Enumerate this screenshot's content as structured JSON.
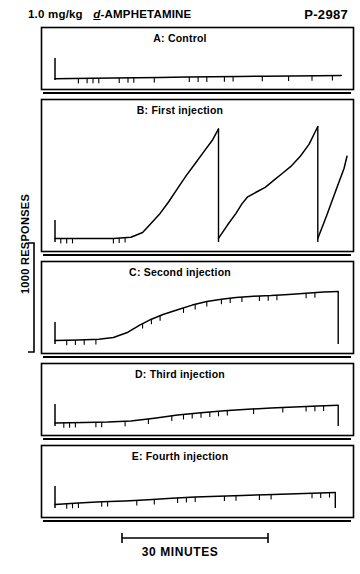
{
  "header": {
    "dose": "1.0 mg/kg",
    "drug_prefix": "d",
    "drug": "-AMPHETAMINE",
    "title_full": "1.0 mg/kg d-AMPHETAMINE",
    "subject_id": "P-2987"
  },
  "axes": {
    "y_label": "1000 RESPONSES",
    "x_label": "30 MINUTES"
  },
  "chart_data": {
    "type": "line",
    "title": "1.0 mg/kg d-AMPHETAMINE",
    "subtitle": "P-2987",
    "xlabel": "30 MINUTES",
    "ylabel": "1000 RESPONSES",
    "grid": false,
    "legend": "none",
    "xlim": [
      0,
      100
    ],
    "ylim": [
      0,
      100
    ],
    "panels": [
      {
        "id": "A",
        "label": "A: Control",
        "panel_letter": "A",
        "panel_title": "Control",
        "segments": [
          {
            "points": [
              [
                0,
                4
              ],
              [
                6,
                5
              ],
              [
                13,
                6
              ],
              [
                20,
                7
              ],
              [
                28,
                8
              ],
              [
                36,
                9
              ],
              [
                45,
                10
              ],
              [
                54,
                11
              ],
              [
                63,
                12
              ],
              [
                72,
                13
              ],
              [
                81,
                14
              ],
              [
                90,
                15
              ],
              [
                98,
                16
              ]
            ],
            "reset_after": false
          }
        ],
        "pip_marks": [
          8,
          11,
          13,
          15,
          22,
          25,
          27,
          34,
          46,
          49,
          52,
          58,
          61,
          71,
          80,
          88,
          95
        ],
        "baseline_start": 4,
        "peak_value": 16
      },
      {
        "id": "B",
        "label": "B: First injection",
        "panel_letter": "B",
        "panel_title": "First injection",
        "segments": [
          {
            "points": [
              [
                0,
                3
              ],
              [
                10,
                3
              ],
              [
                20,
                3
              ],
              [
                26,
                4
              ],
              [
                30,
                8
              ],
              [
                33,
                16
              ],
              [
                36,
                24
              ],
              [
                39,
                34
              ],
              [
                42,
                45
              ],
              [
                45,
                56
              ],
              [
                48,
                66
              ],
              [
                51,
                76
              ],
              [
                54,
                86
              ],
              [
                56,
                95
              ]
            ],
            "reset_after": true
          },
          {
            "points": [
              [
                56,
                3
              ],
              [
                59,
                14
              ],
              [
                62,
                24
              ],
              [
                64,
                32
              ],
              [
                66,
                38
              ],
              [
                69,
                42
              ],
              [
                72,
                46
              ],
              [
                75,
                52
              ],
              [
                78,
                58
              ],
              [
                81,
                64
              ],
              [
                84,
                72
              ],
              [
                87,
                82
              ],
              [
                89,
                92
              ],
              [
                90,
                97
              ]
            ],
            "reset_after": true
          },
          {
            "points": [
              [
                90,
                3
              ],
              [
                93,
                22
              ],
              [
                96,
                42
              ],
              [
                99,
                62
              ],
              [
                100,
                72
              ]
            ],
            "reset_after": false
          }
        ],
        "pip_marks": [
          2,
          4,
          6,
          20,
          22,
          24
        ],
        "baseline_start": 3,
        "peak_value": 97
      },
      {
        "id": "C",
        "label": "C: Second injection",
        "panel_letter": "C",
        "panel_title": "Second injection",
        "segments": [
          {
            "points": [
              [
                0,
                6
              ],
              [
                8,
                7
              ],
              [
                15,
                8
              ],
              [
                20,
                11
              ],
              [
                25,
                20
              ],
              [
                29,
                32
              ],
              [
                33,
                42
              ],
              [
                37,
                50
              ],
              [
                42,
                58
              ],
              [
                47,
                66
              ],
              [
                52,
                72
              ],
              [
                57,
                76
              ],
              [
                62,
                79
              ],
              [
                68,
                81
              ],
              [
                74,
                82
              ],
              [
                80,
                84
              ],
              [
                86,
                86
              ],
              [
                92,
                88
              ],
              [
                97,
                89
              ]
            ],
            "reset_after": true
          }
        ],
        "pip_marks": [
          4,
          7,
          10,
          14,
          30,
          33,
          36,
          44,
          48,
          52,
          57,
          60,
          64,
          70,
          73,
          76,
          86,
          89
        ],
        "baseline_start": 6,
        "peak_value": 89
      },
      {
        "id": "D",
        "label": "D: Third injection",
        "panel_letter": "D",
        "panel_title": "Third injection",
        "segments": [
          {
            "points": [
              [
                0,
                8
              ],
              [
                10,
                9
              ],
              [
                18,
                10
              ],
              [
                26,
                13
              ],
              [
                34,
                20
              ],
              [
                42,
                28
              ],
              [
                50,
                34
              ],
              [
                58,
                39
              ],
              [
                66,
                43
              ],
              [
                74,
                46
              ],
              [
                82,
                49
              ],
              [
                90,
                51
              ],
              [
                97,
                53
              ]
            ],
            "reset_after": true
          }
        ],
        "pip_marks": [
          3,
          5,
          7,
          14,
          16,
          24,
          32,
          40,
          44,
          47,
          50,
          53,
          56,
          59,
          68,
          78,
          86,
          89,
          92
        ],
        "baseline_start": 8,
        "peak_value": 53
      },
      {
        "id": "E",
        "label": "E: Fourth injection",
        "panel_letter": "E",
        "panel_title": "Fourth injection",
        "segments": [
          {
            "points": [
              [
                0,
                9
              ],
              [
                8,
                13
              ],
              [
                16,
                16
              ],
              [
                24,
                18
              ],
              [
                32,
                21
              ],
              [
                40,
                25
              ],
              [
                48,
                28
              ],
              [
                56,
                30
              ],
              [
                64,
                32
              ],
              [
                72,
                34
              ],
              [
                80,
                36
              ],
              [
                88,
                38
              ],
              [
                96,
                40
              ]
            ],
            "reset_after": true
          }
        ],
        "pip_marks": [
          4,
          6,
          8,
          16,
          18,
          28,
          34,
          42,
          45,
          48,
          58,
          62,
          70,
          74,
          88,
          91,
          94
        ],
        "baseline_start": 9,
        "peak_value": 40
      }
    ]
  }
}
